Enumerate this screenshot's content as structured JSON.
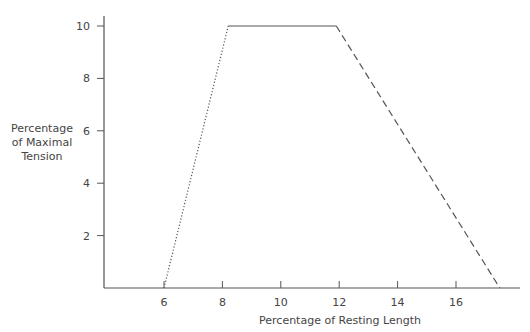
{
  "chart_data": {
    "type": "line",
    "title": "",
    "xlabel": "Percentage of Resting Length",
    "ylabel": [
      "Percentage",
      "of Maximal",
      "Tension"
    ],
    "xlim": [
      4,
      18
    ],
    "ylim": [
      0,
      10
    ],
    "x_ticks": [
      6,
      8,
      10,
      12,
      14,
      16
    ],
    "y_ticks": [
      2,
      4,
      6,
      8,
      10
    ],
    "grid": false,
    "legend": null,
    "series": [
      {
        "name": "ascending limb",
        "style": "dotted",
        "x": [
          6,
          8.2
        ],
        "y": [
          0,
          10
        ]
      },
      {
        "name": "plateau",
        "style": "solid",
        "x": [
          8.2,
          11.9
        ],
        "y": [
          10,
          10
        ]
      },
      {
        "name": "descending limb",
        "style": "dashed",
        "x": [
          11.9,
          17.5
        ],
        "y": [
          10,
          0
        ]
      }
    ]
  }
}
